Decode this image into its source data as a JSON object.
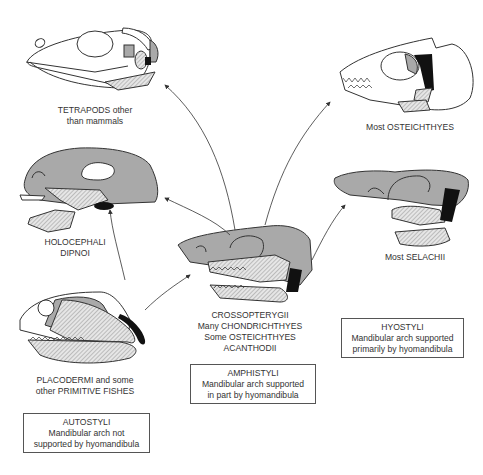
{
  "colors": {
    "bone_grey": "#a9a9a9",
    "hatch": "#bdbdbd",
    "hyomandibula": "#111111",
    "outline": "#333333"
  },
  "taxa": {
    "tetrapods": {
      "line1": "TETRAPODS other",
      "line2": "than mammals"
    },
    "holocephali": {
      "line1": "HOLOCEPHALI",
      "line2": "DIPNOI"
    },
    "placodermi": {
      "line1": "PLACODERMI and some",
      "line2": "other PRIMITIVE FISHES"
    },
    "crossopterygii": {
      "line1": "CROSSOPTERYGII",
      "line2": "Many CHONDRICHTHYES",
      "line3": "Some OSTEICHTHYES",
      "line4": "ACANTHODII"
    },
    "osteichthyes": {
      "line1": "Most OSTEICHTHYES"
    },
    "selachii": {
      "line1": "Most SELACHII"
    }
  },
  "suspension_types": {
    "autostyli": {
      "title": "AUTOSTYLI",
      "line1": "Mandibular arch not",
      "line2": "supported by hyomandibula"
    },
    "amphistyli": {
      "title": "AMPHISTYLI",
      "line1": "Mandibular arch supported",
      "line2": "in part by hyomandibula"
    },
    "hyostyli": {
      "title": "HYOSTYLI",
      "line1": "Mandibular arch supported",
      "line2": "primarily by hyomandibula"
    }
  }
}
